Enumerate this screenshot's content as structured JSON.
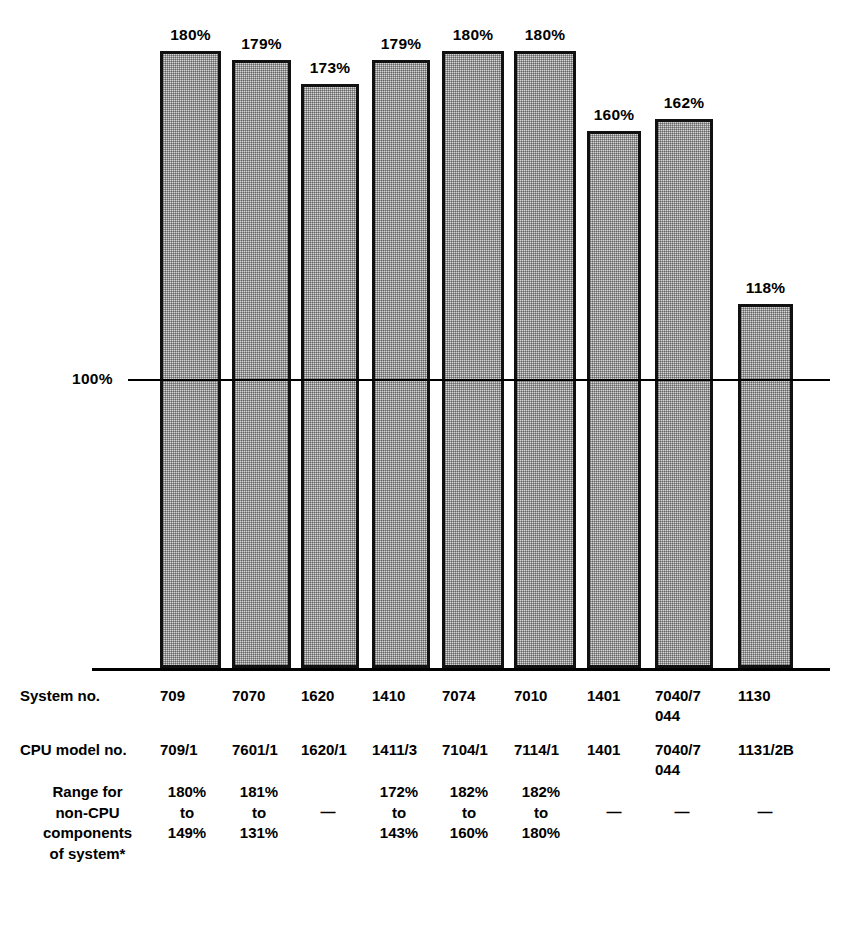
{
  "chart_data": {
    "type": "bar",
    "title": "",
    "xlabel": "",
    "ylabel": "",
    "reference_line": {
      "label": "100%",
      "value": 100
    },
    "grid": false,
    "legend": false,
    "categories": [
      "709",
      "7070",
      "1620",
      "1410",
      "7074",
      "7010",
      "1401",
      "7040/7044",
      "1130"
    ],
    "values": [
      180,
      179,
      173,
      179,
      180,
      180,
      160,
      162,
      118
    ],
    "value_labels": [
      "180%",
      "179%",
      "173%",
      "179%",
      "180%",
      "180%",
      "160%",
      "162%",
      "118%"
    ],
    "bar_geometry": [
      {
        "left": 160,
        "width": 61,
        "top": 51
      },
      {
        "left": 232,
        "width": 59,
        "top": 60
      },
      {
        "left": 301,
        "width": 58,
        "top": 84
      },
      {
        "left": 372,
        "width": 58,
        "top": 60
      },
      {
        "left": 442,
        "width": 62,
        "top": 51
      },
      {
        "left": 514,
        "width": 62,
        "top": 51
      },
      {
        "left": 587,
        "width": 54,
        "top": 131
      },
      {
        "left": 655,
        "width": 58,
        "top": 119
      },
      {
        "left": 738,
        "width": 55,
        "top": 304
      }
    ],
    "baseline_y": 668,
    "reference_y": 379
  },
  "table": {
    "rows": [
      {
        "label": "System no.",
        "label_top": 14,
        "values": [
          "709",
          "7070",
          "1620",
          "1410",
          "7074",
          "7010",
          "1401",
          "7040/7\n044",
          "1130"
        ]
      },
      {
        "label": "CPU model no.",
        "label_top": 68,
        "values": [
          "709/1",
          "7601/1",
          "1620/1",
          "1411/3",
          "7104/1",
          "7114/1",
          "1401",
          "7040/7\n044",
          "1131/2B"
        ]
      }
    ],
    "range_row": {
      "label": "Range for\nnon-CPU\ncomponents\nof system*",
      "values": [
        "180%\nto\n149%",
        "181%\nto\n131%",
        "—",
        "172%\nto\n143%",
        "182%\nto\n160%",
        "182%\nto\n180%",
        "—",
        "—",
        "—"
      ]
    },
    "column_x": [
      160,
      232,
      301,
      372,
      442,
      514,
      587,
      655,
      738
    ]
  }
}
